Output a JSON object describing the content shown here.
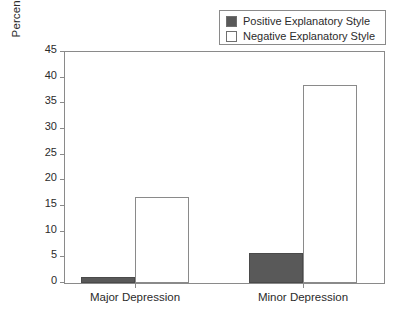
{
  "chart_data": {
    "type": "bar",
    "title": "",
    "xlabel": "",
    "ylabel": "Percent Experiencing Depression",
    "categories": [
      "Major Depression",
      "Minor Depression"
    ],
    "series": [
      {
        "name": "Positive Explanatory Style",
        "values": [
          1.1,
          5.9
        ],
        "color": "#595959"
      },
      {
        "name": "Negative Explanatory Style",
        "values": [
          16.8,
          38.6
        ],
        "color": "#ffffff"
      }
    ],
    "ylim": [
      0,
      45
    ],
    "ytick_values": [
      0,
      5,
      10,
      15,
      20,
      25,
      30,
      35,
      40,
      45
    ],
    "ytick_labels": [
      "0",
      "5",
      "10",
      "15",
      "20",
      "25",
      "30",
      "35",
      "40",
      "45"
    ],
    "grid": false,
    "legend_position": "top-right"
  },
  "legend": {
    "items": [
      {
        "label": "Positive Explanatory Style",
        "swatch": "filled-dark-swatch"
      },
      {
        "label": "Negative Explanatory Style",
        "swatch": "open-white-swatch"
      }
    ]
  },
  "colors": {
    "positive_fill": "#595959",
    "negative_fill": "#ffffff",
    "axis": "#8a8a8a",
    "text": "#2b2b2b",
    "background": "#ffffff"
  }
}
